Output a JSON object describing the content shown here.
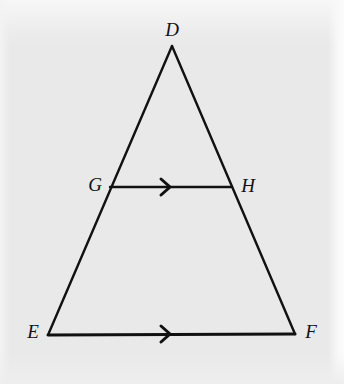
{
  "figure": {
    "background_color": "#e9e9e9",
    "stroke_color": "#111111",
    "label_color": "#111111",
    "width": 344,
    "height": 384
  },
  "chart_data": {
    "type": "diagram",
    "subtype": "euclidean-geometry-triangle",
    "points": [
      {
        "id": "D",
        "label": "D",
        "x": 172,
        "y": 46,
        "label_x": 172,
        "label_y": 29
      },
      {
        "id": "E",
        "label": "E",
        "x": 48,
        "y": 335,
        "label_x": 33,
        "label_y": 331
      },
      {
        "id": "F",
        "label": "F",
        "x": 295,
        "y": 334,
        "label_x": 311,
        "label_y": 331
      },
      {
        "id": "G",
        "label": "G",
        "x": 110,
        "y": 187,
        "label_x": 95,
        "label_y": 184
      },
      {
        "id": "H",
        "label": "H",
        "x": 232,
        "y": 187,
        "label_x": 248,
        "label_y": 185
      }
    ],
    "segments": [
      {
        "id": "DE",
        "from": "D",
        "to": "E",
        "stroke_width": 2.4,
        "arrow": false
      },
      {
        "id": "DF",
        "from": "D",
        "to": "F",
        "stroke_width": 2.4,
        "arrow": false
      },
      {
        "id": "EF",
        "from": "E",
        "to": "F",
        "stroke_width": 3.0,
        "arrow": true
      },
      {
        "id": "GH",
        "from": "G",
        "to": "H",
        "stroke_width": 2.4,
        "arrow": true
      }
    ],
    "arrow_marks": [
      {
        "id": "gh-arrow",
        "on_segment": "GH",
        "x": 170,
        "y": 187,
        "style": "chevron",
        "direction": "right"
      },
      {
        "id": "ef-arrow",
        "on_segment": "EF",
        "x": 170,
        "y": 334,
        "style": "chevron",
        "direction": "right"
      }
    ],
    "annotations": []
  },
  "labels": {
    "D": "D",
    "E": "E",
    "F": "F",
    "G": "G",
    "H": "H"
  }
}
